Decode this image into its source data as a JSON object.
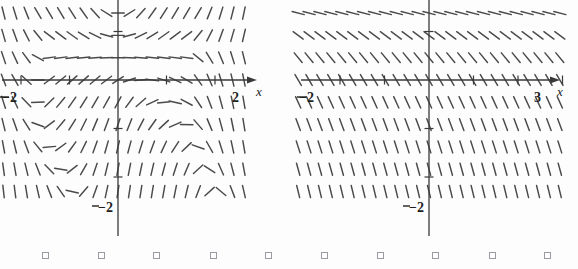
{
  "figure": {
    "kind": "slope-field-pair",
    "background": "#fdfdfd",
    "stroke_color": "#4a4a4a",
    "axis_color": "#3a3a3a"
  },
  "panels": [
    {
      "id": "left",
      "name": "slope-field-left",
      "x_axis_label": "x",
      "x_left_tick_label": "−2",
      "x_right_tick_label": "2",
      "y_bottom_tick_label": "−2",
      "xlim": [
        -2.7,
        2.75
      ],
      "ylim": [
        -2.45,
        2.4
      ],
      "grid": false,
      "ticks_x": [
        -2,
        -1,
        1,
        2
      ],
      "ticks_y": [
        -2,
        -1,
        1,
        2
      ]
    },
    {
      "id": "right",
      "name": "slope-field-right",
      "x_axis_label": "x",
      "x_left_tick_label": "−2",
      "x_right_tick_label": "3",
      "y_bottom_tick_label": "−2",
      "xlim": [
        -2.75,
        3.3
      ],
      "ylim": [
        -2.45,
        2.4
      ],
      "grid": false,
      "ticks_x": [
        -2,
        -1,
        1,
        2,
        3
      ],
      "ticks_y": [
        -2,
        -1,
        1,
        2
      ]
    }
  ],
  "chart_data": [
    {
      "type": "scatter",
      "subtype": "slope-field",
      "title": "",
      "xlabel": "x",
      "ylabel": "",
      "xlim": [
        -2.7,
        2.75
      ],
      "ylim": [
        -2.45,
        2.4
      ],
      "grid": false,
      "xticks": [
        -2,
        -1,
        0,
        1,
        2
      ],
      "yticks": [
        -2,
        -1,
        0,
        1,
        2
      ],
      "xtick_labels": [
        "−2",
        "",
        "",
        "",
        "2"
      ],
      "ytick_labels": [
        "−2",
        "",
        "",
        "",
        ""
      ],
      "slope_rule": "dy/dx varies with both x and y; near-horizontal band along y-axis upper region, steep negative at left and right edges, positive swirl in lower-left quadrant",
      "sample_points": [
        {
          "x": -2.4,
          "y": 2.0,
          "slope": -2.4
        },
        {
          "x": -1.2,
          "y": 2.0,
          "slope": -1.1
        },
        {
          "x": 0.0,
          "y": 2.0,
          "slope": 0.0
        },
        {
          "x": 1.2,
          "y": 2.0,
          "slope": 1.1
        },
        {
          "x": 2.4,
          "y": 2.0,
          "slope": 2.4
        },
        {
          "x": -2.4,
          "y": 1.0,
          "slope": -2.0
        },
        {
          "x": 0.0,
          "y": 1.0,
          "slope": 0.0
        },
        {
          "x": 2.4,
          "y": 1.0,
          "slope": 2.0
        },
        {
          "x": -2.4,
          "y": 0.0,
          "slope": -1.6
        },
        {
          "x": 0.0,
          "y": 0.0,
          "slope": 0.0
        },
        {
          "x": 2.4,
          "y": 0.0,
          "slope": -1.6
        },
        {
          "x": -2.4,
          "y": -1.0,
          "slope": -1.2
        },
        {
          "x": 0.0,
          "y": -1.0,
          "slope": 1.5
        },
        {
          "x": 2.4,
          "y": -1.0,
          "slope": -1.6
        },
        {
          "x": -2.4,
          "y": -2.2,
          "slope": 0.1
        },
        {
          "x": 0.0,
          "y": -2.2,
          "slope": 2.6
        },
        {
          "x": 2.4,
          "y": -2.2,
          "slope": 0.1
        }
      ]
    },
    {
      "type": "scatter",
      "subtype": "slope-field",
      "title": "",
      "xlabel": "x",
      "ylabel": "",
      "xlim": [
        -2.75,
        3.3
      ],
      "ylim": [
        -2.45,
        2.4
      ],
      "grid": false,
      "xticks": [
        -2,
        -1,
        0,
        1,
        2,
        3
      ],
      "yticks": [
        -2,
        -1,
        0,
        1,
        2
      ],
      "xtick_labels": [
        "−2",
        "",
        "",
        "",
        "",
        "3"
      ],
      "ytick_labels": [
        "−2",
        "",
        "",
        "",
        ""
      ],
      "slope_rule": "dy/dx depends only on y; zero (horizontal) near y = 1.6, becoming increasingly negative as y decreases",
      "sample_points": [
        {
          "x": 0,
          "y": 2.1,
          "slope": -0.35
        },
        {
          "x": 0,
          "y": 1.6,
          "slope": 0.0
        },
        {
          "x": 0,
          "y": 1.1,
          "slope": -0.55
        },
        {
          "x": 0,
          "y": 0.6,
          "slope": -1.1
        },
        {
          "x": 0,
          "y": 0.0,
          "slope": -1.7
        },
        {
          "x": 0,
          "y": -0.5,
          "slope": -2.1
        },
        {
          "x": 0,
          "y": -1.0,
          "slope": -2.4
        },
        {
          "x": 0,
          "y": -1.6,
          "slope": -2.7
        },
        {
          "x": 0,
          "y": -2.2,
          "slope": -2.9
        }
      ]
    }
  ],
  "bottom_markers": {
    "name": "page-bullet-squares",
    "count": 10,
    "glyph": "□",
    "positions_px": [
      42,
      98,
      153,
      210,
      265,
      321,
      377,
      432,
      489,
      544
    ]
  }
}
